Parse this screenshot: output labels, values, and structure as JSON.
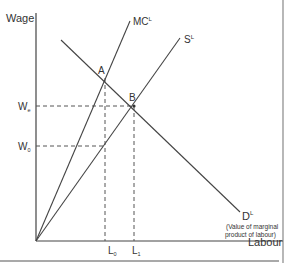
{
  "diagram": {
    "y_axis_label": "Wage",
    "x_axis_label": "Labour",
    "curves": {
      "mc": {
        "label": "MC",
        "sup": "L"
      },
      "supply": {
        "label": "S",
        "sup": "L"
      },
      "demand": {
        "label": "D",
        "sup": "L",
        "note_line1": "(Value of marginal",
        "note_line2": "product of labour)"
      }
    },
    "points": {
      "a": "A",
      "b": "B"
    },
    "wage_levels": {
      "we": {
        "label": "W",
        "sub": "e"
      },
      "w0": {
        "label": "W",
        "sub": "0"
      }
    },
    "labour_levels": {
      "l0": {
        "label": "L",
        "sub": "0"
      },
      "l1": {
        "label": "L",
        "sub": "1"
      }
    },
    "colors": {
      "line": "#444444",
      "text": "#333333",
      "dashed": "#555555"
    }
  }
}
